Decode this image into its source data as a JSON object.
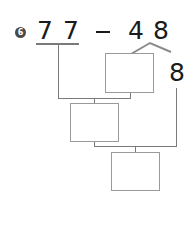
{
  "problem": {
    "number": "6",
    "minuend_digits": [
      "7",
      "7"
    ],
    "operator": "—",
    "subtrahend_digits": [
      "4",
      "8"
    ],
    "split_value": "8"
  },
  "boxes": [
    {
      "id": "box-split-remainder",
      "value": ""
    },
    {
      "id": "box-intermediate",
      "value": ""
    },
    {
      "id": "box-answer",
      "value": ""
    }
  ],
  "colors": {
    "text": "#1a1a1a",
    "lines": "#7a7a7a",
    "box_border": "#9a9a9a",
    "badge": "#4a4a4a"
  }
}
